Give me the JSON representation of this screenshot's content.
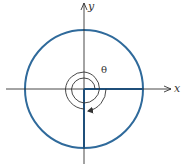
{
  "diagram": {
    "labels": {
      "x_axis": "x",
      "y_axis": "y",
      "angle": "θ"
    },
    "colors": {
      "circle": "#2f6a9b",
      "axes": "#333333",
      "terminal_side": "#1f4f7a",
      "spiral": "#333333"
    },
    "geometry": {
      "center": [
        84,
        89
      ],
      "radius": 59,
      "spiral_inner_radius": 11,
      "spiral_outer_radius": 22
    }
  }
}
